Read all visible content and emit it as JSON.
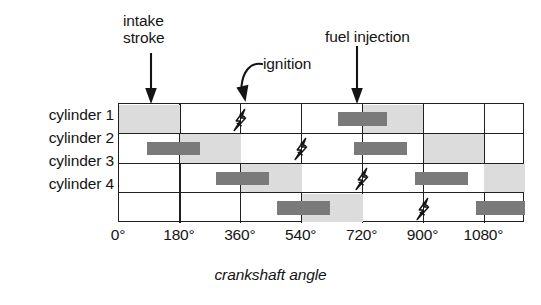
{
  "annotations": {
    "intake_stroke": "intake\nstroke",
    "ignition": "ignition",
    "fuel_injection": "fuel injection"
  },
  "axis": {
    "caption": "crankshaft angle",
    "ticks": [
      "0°",
      "180°",
      "360°",
      "540°",
      "720°",
      "900°",
      "1080°"
    ]
  },
  "rows": [
    {
      "label": "cylinder 1"
    },
    {
      "label": "cylinder 2"
    },
    {
      "label": "cylinder 3"
    },
    {
      "label": "cylinder 4"
    }
  ],
  "colors": {
    "intake_fill": "#dcdcdc",
    "injection_fill": "#7a7a7a",
    "grid": "#231f20",
    "text": "#141414",
    "background": "#ffffff"
  },
  "chart_data": {
    "type": "bar",
    "title": "",
    "subtitle": "",
    "xlabel": "crankshaft angle",
    "ylabel": "",
    "xlim": [
      0,
      1200
    ],
    "ylim": [
      0,
      4
    ],
    "grid": true,
    "legend": "none",
    "x_tick_values": [
      0,
      180,
      360,
      540,
      720,
      900,
      1080
    ],
    "x_tick_labels": [
      "0°",
      "180°",
      "360°",
      "540°",
      "720°",
      "900°",
      "1080°"
    ],
    "categories": [
      "cylinder 1",
      "cylinder 2",
      "cylinder 3",
      "cylinder 4"
    ],
    "series": [
      {
        "name": "intake stroke",
        "kind": "span",
        "fill": "#dcdcdc",
        "values": [
          {
            "cylinder": "cylinder 1",
            "spans": [
              [
                0,
                180
              ],
              [
                720,
                900
              ]
            ]
          },
          {
            "cylinder": "cylinder 2",
            "spans": [
              [
                180,
                360
              ],
              [
                900,
                1080
              ]
            ]
          },
          {
            "cylinder": "cylinder 3",
            "spans": [
              [
                360,
                540
              ],
              [
                1080,
                1200
              ]
            ]
          },
          {
            "cylinder": "cylinder 4",
            "spans": [
              [
                540,
                720
              ]
            ]
          }
        ]
      },
      {
        "name": "fuel injection",
        "kind": "span",
        "fill": "#7a7a7a",
        "values": [
          {
            "cylinder": "cylinder 1",
            "spans": [
              [
                648,
                792
              ]
            ]
          },
          {
            "cylinder": "cylinder 2",
            "spans": [
              [
                84,
                240
              ],
              [
                696,
                852
              ]
            ]
          },
          {
            "cylinder": "cylinder 3",
            "spans": [
              [
                288,
                444
              ],
              [
                876,
                1032
              ]
            ]
          },
          {
            "cylinder": "cylinder 4",
            "spans": [
              [
                468,
                624
              ],
              [
                1056,
                1200
              ]
            ]
          }
        ]
      },
      {
        "name": "ignition",
        "kind": "marker",
        "marker": "lightning-bolt",
        "values": [
          {
            "cylinder": "cylinder 1",
            "at": [
              360
            ]
          },
          {
            "cylinder": "cylinder 2",
            "at": [
              540
            ]
          },
          {
            "cylinder": "cylinder 3",
            "at": [
              720
            ]
          },
          {
            "cylinder": "cylinder 4",
            "at": [
              900
            ]
          }
        ]
      }
    ],
    "annotations": [
      {
        "text": "intake stroke",
        "points_to": 90,
        "cylinder": "cylinder 1",
        "arrow": "straight-down"
      },
      {
        "text": "ignition",
        "points_to": 360,
        "cylinder": "cylinder 1",
        "arrow": "curved"
      },
      {
        "text": "fuel injection",
        "points_to": 700,
        "cylinder": "cylinder 1",
        "arrow": "straight-down"
      }
    ]
  }
}
